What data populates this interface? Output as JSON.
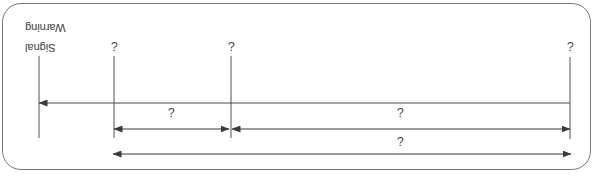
{
  "figure": {
    "orientation_degrees": 180,
    "panel": {
      "border_color": "#777777",
      "background": "#ffffff",
      "corner_radius_px": 19
    },
    "line_color": "#4a4a4a",
    "text_color": "#3d3d3d",
    "dimension_lines": [
      {
        "id": "overall-span",
        "label": "¿",
        "arrow_style": "double",
        "label_x": 193,
        "label_y": 27
      },
      {
        "id": "left-segment",
        "label": "¿",
        "arrow_style": "double",
        "label_x": 193,
        "label_y": 56
      },
      {
        "id": "right-segment",
        "label": "¿",
        "arrow_style": "double",
        "label_x": 422,
        "label_y": 56
      }
    ],
    "station_labels": [
      {
        "id": "station-1",
        "text": "¿",
        "x": 23,
        "y": 122
      },
      {
        "id": "station-2",
        "text": "¿",
        "x": 362,
        "y": 122
      },
      {
        "id": "station-3",
        "text": "¿",
        "x": 479,
        "y": 122
      }
    ],
    "signal_label": {
      "line1": "Signal",
      "line2": "Warning"
    },
    "baseline": {
      "id": "main-axis",
      "arrow_style": "single-right"
    }
  }
}
